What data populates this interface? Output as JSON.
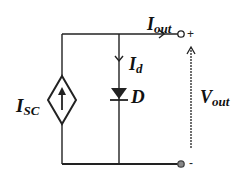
{
  "diagram": {
    "labels": {
      "iout": {
        "main": "I",
        "sub": "out"
      },
      "id": {
        "main": "I",
        "sub": "d"
      },
      "isc": {
        "main": "I",
        "sub": "SC"
      },
      "diode": "D",
      "vout": {
        "main": "V",
        "sub": "out"
      }
    },
    "terminals": {
      "plus": "+",
      "minus": "-"
    },
    "colors": {
      "wire": "#222222",
      "terminal_minus_fill": "#888888"
    }
  }
}
